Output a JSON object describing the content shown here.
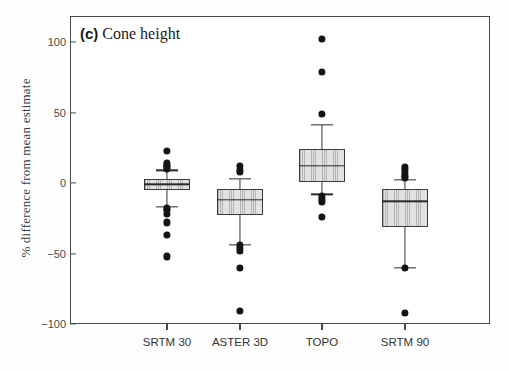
{
  "figure": {
    "panel_tag": "(c)",
    "panel_title": "Cone height",
    "ylabel": "% difference from mean estimate"
  },
  "chart_data": {
    "type": "box",
    "title": "(c) Cone height",
    "xlabel": "",
    "ylabel": "% difference from mean estimate",
    "ylim": [
      -100,
      115
    ],
    "yticks": [
      100,
      50,
      0,
      -50,
      -100
    ],
    "ytick_labels": [
      "100",
      "50",
      "0",
      "−50",
      "−100"
    ],
    "grid": false,
    "legend": "none",
    "categories": [
      "SRTM 30",
      "ASTER 3D",
      "TOPO",
      "SRTM 90"
    ],
    "boxes": [
      {
        "category": "SRTM 30",
        "whisker_low": -17,
        "q1": -5,
        "median": -1,
        "q3": 3,
        "whisker_high": 9,
        "outliers": [
          23,
          14,
          13,
          12,
          11,
          10,
          -18,
          -19,
          -22,
          -28,
          -37,
          -52
        ]
      },
      {
        "category": "ASTER 3D",
        "whisker_low": -44,
        "q1": -23,
        "median": -12,
        "q3": -4,
        "whisker_high": 3,
        "outliers": [
          12,
          9,
          8,
          -44,
          -46,
          -48,
          -60,
          -91
        ]
      },
      {
        "category": "TOPO",
        "whisker_low": -8,
        "q1": 1,
        "median": 12,
        "q3": 24,
        "whisker_high": 41,
        "outliers": [
          102,
          79,
          49,
          -9,
          -11,
          -13,
          -24
        ]
      },
      {
        "category": "SRTM 90",
        "whisker_low": -60,
        "q1": -31,
        "median": -13,
        "q3": -4,
        "whisker_high": 2,
        "outliers": [
          11,
          9,
          7,
          5,
          4,
          -60,
          -92
        ]
      }
    ]
  },
  "colors": {
    "box_fill": "#e2e2e2",
    "box_edge": "#3a3a3a",
    "outlier": "#141414",
    "axis": "#4a4a4a",
    "text": "#333333"
  }
}
